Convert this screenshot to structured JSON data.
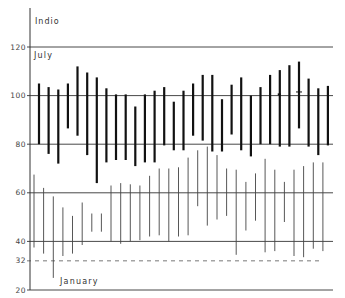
{
  "chart_data": {
    "type": "range-bar",
    "title": "Indio",
    "xlabel": "",
    "ylabel": "",
    "ylim": [
      20,
      128
    ],
    "yticks": [
      20,
      32,
      40,
      60,
      80,
      100,
      120
    ],
    "ytick_labels": [
      "20",
      "32",
      "40",
      "60",
      "80",
      "100",
      "120"
    ],
    "grid": true,
    "reference_line": {
      "value": 32,
      "style": "dashed"
    },
    "days": [
      1,
      2,
      3,
      4,
      5,
      6,
      7,
      8,
      9,
      10,
      11,
      12,
      13,
      14,
      15,
      16,
      17,
      18,
      19,
      20,
      21,
      22,
      23,
      24,
      25,
      26,
      27,
      28,
      29,
      30,
      31
    ],
    "series": [
      {
        "name": "July",
        "style": "thick",
        "high": [
          105,
          103.5,
          102.5,
          105,
          112,
          109.5,
          107.5,
          103,
          100.5,
          100.5,
          95.5,
          100.5,
          102,
          103.5,
          97.5,
          102,
          105,
          108.5,
          108.5,
          98.5,
          104.5,
          107.5,
          100,
          103.5,
          108.5,
          110.5,
          112.5,
          114,
          107,
          103,
          104
        ],
        "low": [
          80,
          76,
          72,
          86.5,
          83.5,
          75.5,
          64,
          72.5,
          73.5,
          73.5,
          71,
          72.5,
          72.5,
          79.5,
          77.5,
          77.5,
          83.5,
          81.5,
          77,
          77,
          84,
          77.5,
          75,
          80,
          80,
          79,
          79,
          86.5,
          79,
          75.5,
          79.5
        ]
      },
      {
        "name": "January",
        "style": "thin",
        "high": [
          67.5,
          62,
          58.5,
          54,
          50.5,
          56,
          51.5,
          51.5,
          63,
          64,
          63.5,
          63,
          67,
          70,
          70,
          70.5,
          74.5,
          77.5,
          79,
          75.5,
          70,
          69.5,
          64.5,
          68,
          74,
          69.5,
          64.5,
          69.5,
          71,
          72.5,
          72.5
        ],
        "low": [
          37.5,
          35,
          25,
          34,
          35,
          38.5,
          44,
          44,
          40,
          39,
          40,
          40.5,
          42,
          42.5,
          40,
          42,
          42.5,
          54.5,
          46.5,
          49,
          50.5,
          34.5,
          44.5,
          48.5,
          35.5,
          36,
          48,
          34,
          33.5,
          37,
          36
        ]
      }
    ],
    "annotations": [
      {
        "series": "July",
        "day": 26,
        "value": 100.5,
        "mark": "dot"
      },
      {
        "series": "July",
        "day": 28,
        "value": 101.5,
        "mark": "tick"
      }
    ]
  }
}
